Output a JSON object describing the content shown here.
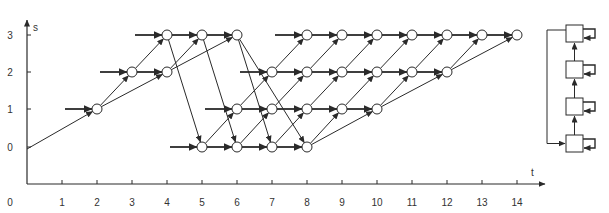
{
  "caption_fragment": "",
  "axes": {
    "x_label": "t",
    "y_label": "s",
    "x_ticks": [
      "0",
      "1",
      "2",
      "3",
      "4",
      "5",
      "6",
      "7",
      "8",
      "9",
      "10",
      "11",
      "12",
      "13",
      "14"
    ],
    "y_ticks": [
      "0",
      "1",
      "2",
      "3"
    ]
  },
  "layout": {
    "x0": 27,
    "dx": 35,
    "y_by_s": {
      "0": 147,
      "1": 109,
      "2": 72,
      "3": 35
    },
    "node_radius": 5,
    "axis_y": 184
  },
  "colors": {
    "line": "#2a2a2a",
    "node_fill": "#ffffff",
    "text": "#333333"
  },
  "nodes": [
    [
      2,
      1
    ],
    [
      3,
      2
    ],
    [
      4,
      2
    ],
    [
      4,
      3
    ],
    [
      5,
      3
    ],
    [
      6,
      3
    ],
    [
      5,
      0
    ],
    [
      6,
      0
    ],
    [
      7,
      0
    ],
    [
      8,
      0
    ],
    [
      6,
      1
    ],
    [
      7,
      1
    ],
    [
      8,
      1
    ],
    [
      9,
      1
    ],
    [
      10,
      1
    ],
    [
      7,
      2
    ],
    [
      8,
      2
    ],
    [
      9,
      2
    ],
    [
      10,
      2
    ],
    [
      11,
      2
    ],
    [
      12,
      2
    ],
    [
      8,
      3
    ],
    [
      9,
      3
    ],
    [
      10,
      3
    ],
    [
      11,
      3
    ],
    [
      12,
      3
    ],
    [
      13,
      3
    ],
    [
      14,
      3
    ]
  ],
  "inputs": [
    {
      "to": [
        2,
        1
      ],
      "from_t": 1.0
    },
    {
      "to": [
        3,
        2
      ],
      "from_t": 2.0
    },
    {
      "to": [
        4,
        3
      ],
      "from_t": 3.0
    },
    {
      "to": [
        5,
        0
      ],
      "from_t": 4.0
    },
    {
      "to": [
        6,
        1
      ],
      "from_t": 5.0
    },
    {
      "to": [
        7,
        2
      ],
      "from_t": 6.0
    },
    {
      "to": [
        8,
        3
      ],
      "from_t": 7.0
    }
  ],
  "edges": [
    {
      "from": [
        0,
        0
      ],
      "to": [
        2,
        1
      ]
    },
    {
      "from": [
        2,
        1
      ],
      "to": [
        3,
        2
      ]
    },
    {
      "from": [
        2,
        1
      ],
      "to": [
        4,
        2
      ]
    },
    {
      "from": [
        3,
        2
      ],
      "to": [
        4,
        2
      ]
    },
    {
      "from": [
        3,
        2
      ],
      "to": [
        4,
        3
      ]
    },
    {
      "from": [
        4,
        2
      ],
      "to": [
        5,
        3
      ]
    },
    {
      "from": [
        4,
        2
      ],
      "to": [
        6,
        3
      ]
    },
    {
      "from": [
        4,
        3
      ],
      "to": [
        5,
        3
      ]
    },
    {
      "from": [
        5,
        3
      ],
      "to": [
        6,
        3
      ]
    },
    {
      "from": [
        4,
        3
      ],
      "to": [
        5,
        0
      ]
    },
    {
      "from": [
        5,
        3
      ],
      "to": [
        6,
        0
      ]
    },
    {
      "from": [
        6,
        3
      ],
      "to": [
        7,
        0
      ]
    },
    {
      "from": [
        6,
        3
      ],
      "to": [
        8,
        0
      ]
    },
    {
      "from": [
        5,
        0
      ],
      "to": [
        6,
        0
      ]
    },
    {
      "from": [
        6,
        0
      ],
      "to": [
        7,
        0
      ]
    },
    {
      "from": [
        7,
        0
      ],
      "to": [
        8,
        0
      ]
    },
    {
      "from": [
        5,
        0
      ],
      "to": [
        6,
        1
      ]
    },
    {
      "from": [
        6,
        0
      ],
      "to": [
        7,
        1
      ]
    },
    {
      "from": [
        7,
        0
      ],
      "to": [
        8,
        1
      ]
    },
    {
      "from": [
        8,
        0
      ],
      "to": [
        9,
        1
      ]
    },
    {
      "from": [
        8,
        0
      ],
      "to": [
        10,
        1
      ]
    },
    {
      "from": [
        6,
        1
      ],
      "to": [
        7,
        1
      ]
    },
    {
      "from": [
        7,
        1
      ],
      "to": [
        8,
        1
      ]
    },
    {
      "from": [
        8,
        1
      ],
      "to": [
        9,
        1
      ]
    },
    {
      "from": [
        9,
        1
      ],
      "to": [
        10,
        1
      ]
    },
    {
      "from": [
        6,
        1
      ],
      "to": [
        7,
        2
      ]
    },
    {
      "from": [
        7,
        1
      ],
      "to": [
        8,
        2
      ]
    },
    {
      "from": [
        8,
        1
      ],
      "to": [
        9,
        2
      ]
    },
    {
      "from": [
        9,
        1
      ],
      "to": [
        10,
        2
      ]
    },
    {
      "from": [
        10,
        1
      ],
      "to": [
        11,
        2
      ]
    },
    {
      "from": [
        10,
        1
      ],
      "to": [
        12,
        2
      ]
    },
    {
      "from": [
        7,
        2
      ],
      "to": [
        8,
        2
      ]
    },
    {
      "from": [
        8,
        2
      ],
      "to": [
        9,
        2
      ]
    },
    {
      "from": [
        9,
        2
      ],
      "to": [
        10,
        2
      ]
    },
    {
      "from": [
        10,
        2
      ],
      "to": [
        11,
        2
      ]
    },
    {
      "from": [
        11,
        2
      ],
      "to": [
        12,
        2
      ]
    },
    {
      "from": [
        7,
        2
      ],
      "to": [
        8,
        3
      ]
    },
    {
      "from": [
        8,
        2
      ],
      "to": [
        9,
        3
      ]
    },
    {
      "from": [
        9,
        2
      ],
      "to": [
        10,
        3
      ]
    },
    {
      "from": [
        10,
        2
      ],
      "to": [
        11,
        3
      ]
    },
    {
      "from": [
        11,
        2
      ],
      "to": [
        12,
        3
      ]
    },
    {
      "from": [
        12,
        2
      ],
      "to": [
        13,
        3
      ]
    },
    {
      "from": [
        12,
        2
      ],
      "to": [
        14,
        3
      ]
    },
    {
      "from": [
        8,
        3
      ],
      "to": [
        9,
        3
      ]
    },
    {
      "from": [
        9,
        3
      ],
      "to": [
        10,
        3
      ]
    },
    {
      "from": [
        10,
        3
      ],
      "to": [
        11,
        3
      ]
    },
    {
      "from": [
        11,
        3
      ],
      "to": [
        12,
        3
      ]
    },
    {
      "from": [
        12,
        3
      ],
      "to": [
        13,
        3
      ]
    },
    {
      "from": [
        13,
        3
      ],
      "to": [
        14,
        3
      ]
    }
  ],
  "thick_edges_same_row": true,
  "block_diagram": {
    "boxes": [
      {
        "x": 566,
        "y": 25,
        "w": 17,
        "h": 17
      },
      {
        "x": 566,
        "y": 61,
        "w": 17,
        "h": 17
      },
      {
        "x": 566,
        "y": 98,
        "w": 17,
        "h": 17
      },
      {
        "x": 566,
        "y": 135,
        "w": 17,
        "h": 17
      }
    ],
    "loop_left_x": 547
  }
}
